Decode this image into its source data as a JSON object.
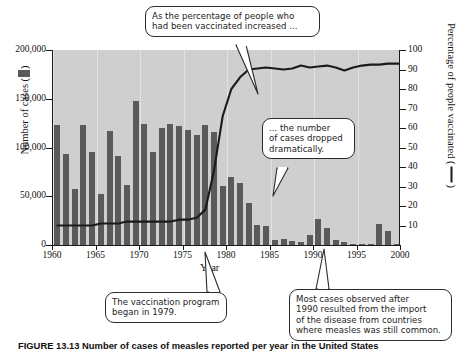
{
  "figure": {
    "caption": "FIGURE 13.13  Number of cases of measles reported per year in the United States",
    "caption_visible_prefix": "FIGURE 13.13  Number of cases of measles..."
  },
  "axes": {
    "x_title": "Year",
    "y_left_title": "Number of cases (",
    "y_left_title_end": ")",
    "y_right_title": "Percentage of people vaccinated (",
    "y_right_title_end": ")",
    "x_ticks": [
      "1960",
      "1965",
      "1970",
      "1975",
      "1980",
      "1985",
      "1990",
      "1995",
      "2000"
    ],
    "y_left_ticks": [
      "200,000",
      "150,000",
      "100,000",
      "50,000",
      "0"
    ],
    "y_right_ticks": [
      "100",
      "90",
      "80",
      "70",
      "60",
      "50",
      "40",
      "30",
      "20",
      "10"
    ]
  },
  "callouts": [
    {
      "id": "callout-vaccination-percentage",
      "lines": [
        "As the percentage of people who",
        "had been vaccinated increased ..."
      ]
    },
    {
      "id": "callout-cases-dropped",
      "lines": [
        "... the number",
        "of cases dropped",
        "dramatically."
      ]
    },
    {
      "id": "callout-program-began",
      "lines": [
        "The vaccination program",
        "began in 1979."
      ]
    },
    {
      "id": "callout-imported-cases",
      "lines": [
        "Most cases observed after",
        "1990 resulted from the import",
        "of the disease from countries",
        "where measles was still common."
      ]
    }
  ],
  "colors": {
    "bar": "#5a5a5a",
    "line": "#1a1a1a",
    "plot_background": "#cfcfcf",
    "gridline": "#e2e2e2",
    "page_background": "#ffffff"
  },
  "chart_data": {
    "type": "bar",
    "xlabel": "Year",
    "ylabel": "Number of cases",
    "ylabel_right": "Percentage of people vaccinated",
    "xlim": [
      1960,
      2000
    ],
    "ylim": [
      0,
      200000
    ],
    "ylim_right": [
      0,
      100
    ],
    "grid": "vertical-only",
    "legend": "inline-axis-swatches",
    "x": [
      1960,
      1961,
      1962,
      1963,
      1964,
      1965,
      1966,
      1967,
      1968,
      1969,
      1970,
      1971,
      1972,
      1973,
      1974,
      1975,
      1976,
      1977,
      1978,
      1979,
      1980,
      1981,
      1982,
      1983,
      1984,
      1985,
      1986,
      1987,
      1988,
      1989,
      1990,
      1991,
      1992,
      1993,
      1994,
      1995,
      1996,
      1997,
      1998,
      1999
    ],
    "series": [
      {
        "name": "Number of cases",
        "axis": "left",
        "type": "bar",
        "values": [
          123000,
          93000,
          57000,
          123000,
          95000,
          52000,
          117000,
          91000,
          62000,
          148000,
          124000,
          95000,
          120000,
          124000,
          122000,
          118000,
          113000,
          123000,
          116000,
          61000,
          70000,
          64000,
          43000,
          21000,
          19000,
          5000,
          6000,
          4000,
          3000,
          10000,
          27000,
          17000,
          5000,
          3000,
          1000,
          500,
          600,
          22000,
          14000,
          1000
        ]
      },
      {
        "name": "Percentage of people vaccinated",
        "axis": "right",
        "type": "line",
        "values": [
          10,
          10,
          10,
          10,
          10,
          11,
          11,
          11,
          12,
          12,
          12,
          12,
          12,
          12,
          13,
          13,
          14,
          18,
          38,
          66,
          80,
          86,
          90,
          90.5,
          91,
          90.5,
          90,
          90.5,
          92,
          91,
          91.5,
          92,
          91,
          89.5,
          91,
          92,
          92.5,
          92.5,
          93,
          93
        ]
      }
    ],
    "annotations": [
      "As the percentage of people who had been vaccinated increased ...",
      "... the number of cases dropped dramatically.",
      "The vaccination program began in 1979.",
      "Most cases observed after 1990 resulted from the import of the disease from countries where measles was still common."
    ]
  }
}
